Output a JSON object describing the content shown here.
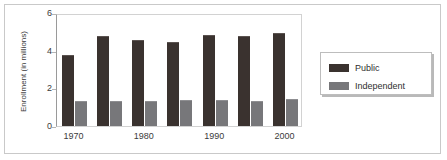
{
  "chart_data": {
    "type": "bar",
    "title": "",
    "xlabel": "",
    "ylabel": "Enrollment (in millions)",
    "ylim": [
      0,
      6
    ],
    "yticks": [
      0,
      2,
      4,
      6
    ],
    "ytick_labels": [
      "0",
      "2",
      "4",
      "6"
    ],
    "grid": false,
    "legend_position": "right",
    "categories": [
      "1970",
      "1975",
      "1980",
      "1985",
      "1990",
      "1995",
      "2000"
    ],
    "visible_xtick_labels": [
      "1970",
      "1980",
      "1990",
      "2000"
    ],
    "visible_xtick_indices": [
      0,
      2,
      4,
      6
    ],
    "series": [
      {
        "name": "Public",
        "color": "#3a322f",
        "values": [
          3.7,
          4.75,
          4.5,
          4.4,
          4.8,
          4.7,
          4.9
        ]
      },
      {
        "name": "Independent",
        "color": "#77777a",
        "values": [
          1.25,
          1.3,
          1.28,
          1.32,
          1.33,
          1.3,
          1.38
        ]
      }
    ]
  },
  "legend": {
    "items": [
      {
        "label": "Public",
        "swatch": "public"
      },
      {
        "label": "Independent",
        "swatch": "independent"
      }
    ]
  },
  "colors": {
    "public": "#3a322f",
    "independent": "#77777a",
    "frame": "#c9c9c9",
    "axis": "#9a9a9a",
    "text": "#3b3b3b"
  }
}
